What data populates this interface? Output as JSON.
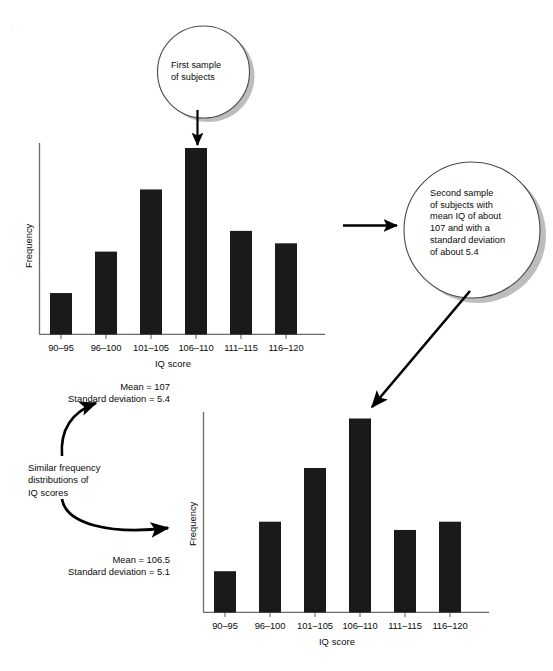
{
  "figure": {
    "background_color": "#ffffff",
    "bar_color": "#1a1a1a",
    "axis_color": "#555555",
    "arrow_color": "#000000",
    "callout_stroke": "#4a4a4a",
    "callout_shadow": "#b4b4b4"
  },
  "callouts": [
    {
      "id": "first-sample",
      "text": "First sample\nof subjects"
    },
    {
      "id": "second-sample",
      "text": "Second sample\nof subjects with\nmean IQ of about\n107 and with a\nstandard deviation\nof about 5.4"
    }
  ],
  "annotations": {
    "similar_note": "Similar frequency\ndistributions of\nIQ scores",
    "top_stats": "Mean = 107\nStandard deviation = 5.4",
    "bottom_stats": "Mean = 106.5\nStandard deviation = 5.1"
  },
  "chart_data": [
    {
      "id": "chart-top",
      "type": "bar",
      "title": "",
      "xlabel": "IQ score",
      "ylabel": "Frequency",
      "categories": [
        "90–95",
        "96–100",
        "101–105",
        "106–110",
        "111–115",
        "116–120"
      ],
      "values": [
        2,
        4,
        7,
        9,
        5,
        4.4
      ],
      "ylim": [
        0,
        10
      ],
      "grid": false,
      "legend": false,
      "mean": 107,
      "standard_deviation": 5.4
    },
    {
      "id": "chart-bottom",
      "type": "bar",
      "title": "",
      "xlabel": "IQ score",
      "ylabel": "Frequency",
      "categories": [
        "90–95",
        "96–100",
        "101–105",
        "106–110",
        "111–115",
        "116–120"
      ],
      "values": [
        2,
        4.4,
        7,
        9.4,
        4,
        4.4
      ],
      "ylim": [
        0,
        10
      ],
      "grid": false,
      "legend": false,
      "mean": 106.5,
      "standard_deviation": 5.1
    }
  ]
}
